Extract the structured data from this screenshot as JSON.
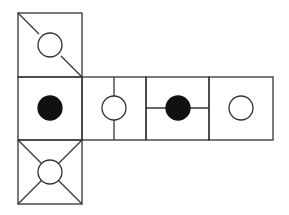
{
  "diagram": {
    "stroke_color": "#333333",
    "fill_dark": "#111111",
    "faces": [
      {
        "id": "top",
        "pattern": "diagonal-line-open-circle"
      },
      {
        "id": "middle-1",
        "pattern": "filled-circle"
      },
      {
        "id": "middle-2",
        "pattern": "vertical-line-open-circle"
      },
      {
        "id": "middle-3",
        "pattern": "horizontal-line-filled-circle"
      },
      {
        "id": "middle-4",
        "pattern": "open-circle"
      },
      {
        "id": "bottom",
        "pattern": "x-diagonals-open-circle"
      }
    ]
  }
}
